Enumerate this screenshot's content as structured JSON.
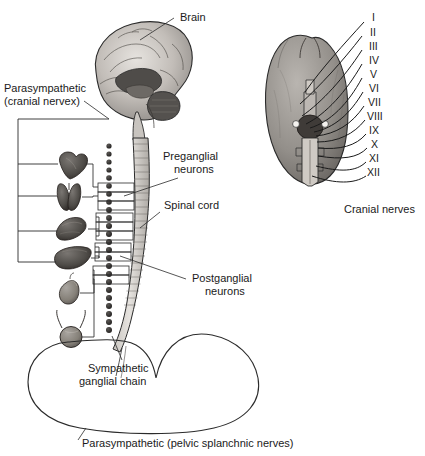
{
  "figure": {
    "background_color": "#ffffff",
    "ink_color": "#1a1a1a"
  },
  "labels": {
    "brain": "Brain",
    "parasympathetic_cranial_line1": "Parasympathetic",
    "parasympathetic_cranial_line2": "(cranial nervex)",
    "preganglial_line1": "Preganglial",
    "preganglial_line2": "neurons",
    "spinal_cord": "Spinal cord",
    "postganglial_line1": "Postganglial",
    "postganglial_line2": "neurons",
    "sympathetic_chain_line1": "Sympathetic",
    "sympathetic_chain_line2": "ganglial chain",
    "parasympathetic_pelvic": "Parasympathetic (pelvic splanchnic nerves)",
    "cranial_nerves_caption": "Cranial nerves"
  },
  "cranial_nerves": {
    "caption": "Cranial nerves",
    "numerals": [
      "I",
      "II",
      "III",
      "IV",
      "V",
      "VI",
      "VII",
      "VIII",
      "IX",
      "X",
      "XI",
      "XII"
    ]
  },
  "organs": [
    {
      "name": "heart"
    },
    {
      "name": "lungs"
    },
    {
      "name": "stomach"
    },
    {
      "name": "liver"
    },
    {
      "name": "kidney"
    },
    {
      "name": "bladder"
    }
  ],
  "colors": {
    "ink": "#1a1a1a",
    "line": "#2b2b2b",
    "brain_light": "#d9d6d2",
    "brain_mid": "#9a9590",
    "brain_dark": "#5d5a57",
    "ganglion": "#2f2c2a",
    "cord_fill": "#d8d5d0",
    "organ_dark": "#4a4744",
    "organ_mid": "#6e6a66",
    "pelvic_organ": "#8d8a86"
  }
}
